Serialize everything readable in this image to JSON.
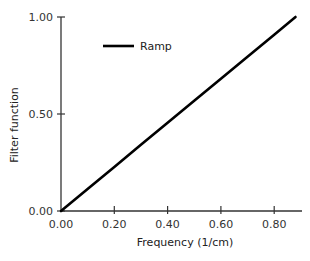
{
  "chart_data": {
    "type": "line",
    "title": "",
    "xlabel": "Frequency (1/cm)",
    "ylabel": "Filter function",
    "xlim": [
      0.0,
      0.88
    ],
    "ylim": [
      0.0,
      1.0
    ],
    "x_ticks": [
      "0.00",
      "0.20",
      "0.40",
      "0.60",
      "0.80"
    ],
    "y_ticks": [
      "0.00",
      "0.50",
      "1.00"
    ],
    "grid": false,
    "legend_position": "upper-left-inside",
    "series": [
      {
        "name": "Ramp",
        "color": "#000000",
        "x": [
          0.0,
          0.1,
          0.2,
          0.3,
          0.4,
          0.5,
          0.6,
          0.7,
          0.8,
          0.88
        ],
        "y": [
          0.0,
          0.114,
          0.227,
          0.341,
          0.455,
          0.568,
          0.682,
          0.795,
          0.909,
          1.0
        ]
      }
    ]
  },
  "legend": {
    "items": [
      {
        "label": "Ramp",
        "color": "#000000"
      }
    ]
  },
  "axes": {
    "x_title": "Frequency (1/cm)",
    "y_title": "Filter function",
    "x_tick_labels": [
      "0.00",
      "0.20",
      "0.40",
      "0.60",
      "0.80"
    ],
    "y_tick_labels": [
      "0.00",
      "0.50",
      "1.00"
    ]
  }
}
